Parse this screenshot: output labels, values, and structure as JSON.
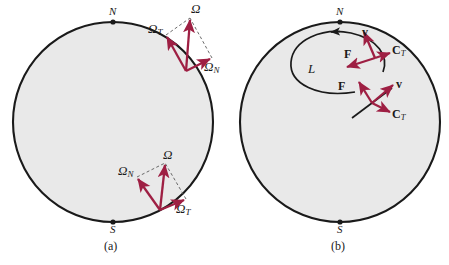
{
  "figure": {
    "type": "physics-diagram",
    "colors": {
      "arrow": "#9e1f43",
      "outline": "#1a1a1a",
      "fill": "#e9e9e9",
      "dashed": "#5a5a5a",
      "background": "#ffffff",
      "text": "#1a1a1a"
    },
    "panels": [
      {
        "id": "a",
        "caption": "(a)",
        "circle": {
          "cx": 113,
          "cy": 122,
          "r": 100
        },
        "poles": [
          {
            "name": "north-pole",
            "label": "N",
            "x": 113,
            "y": 22
          },
          {
            "name": "south-pole",
            "label": "S",
            "x": 113,
            "y": 222
          }
        ],
        "vector_groups": [
          {
            "name": "northern-hemisphere-omega",
            "origin_x": 186,
            "origin_y": 71,
            "vectors": [
              {
                "label": "Ω",
                "sub": "",
                "name": "omega-vector",
                "tip_x": 190,
                "tip_y": 18,
                "label_x": 192,
                "label_y": 4
              },
              {
                "label": "Ω",
                "sub": "T",
                "name": "omega-tangential-vector",
                "tip_x": 166,
                "tip_y": 35,
                "label_x": 149,
                "label_y": 24
              },
              {
                "label": "Ω",
                "sub": "N",
                "name": "omega-normal-vector",
                "tip_x": 212,
                "tip_y": 58,
                "label_x": 206,
                "label_y": 62
              }
            ]
          },
          {
            "name": "southern-hemisphere-omega",
            "origin_x": 160,
            "origin_y": 210,
            "vectors": [
              {
                "label": "Ω",
                "sub": "",
                "name": "omega-vector",
                "tip_x": 165,
                "tip_y": 163,
                "label_x": 166,
                "label_y": 150
              },
              {
                "label": "Ω",
                "sub": "N",
                "name": "omega-normal-vector",
                "tip_x": 137,
                "tip_y": 177,
                "label_x": 120,
                "label_y": 166
              },
              {
                "label": "Ω",
                "sub": "T",
                "name": "omega-tangential-vector",
                "tip_x": 186,
                "tip_y": 199,
                "label_x": 179,
                "label_y": 205
              }
            ]
          }
        ]
      },
      {
        "id": "b",
        "caption": "(b)",
        "circle": {
          "cx": 340,
          "cy": 122,
          "r": 100
        },
        "poles": [
          {
            "name": "north-pole",
            "label": "N",
            "x": 340,
            "y": 22
          },
          {
            "name": "south-pole",
            "label": "S",
            "x": 340,
            "y": 222
          }
        ],
        "trajectory": {
          "name": "trajectory-curve",
          "label": "L",
          "label_x": 310,
          "label_y": 68
        },
        "vector_groups": [
          {
            "name": "upper-force-group",
            "origin_x": 375,
            "origin_y": 58,
            "vectors": [
              {
                "label": "v",
                "sub": "",
                "name": "velocity-vector",
                "tip_x": 363,
                "tip_y": 30,
                "label_x": 364,
                "label_y": 30
              },
              {
                "label": "C",
                "sub": "T",
                "name": "coriolis-tangential-vector",
                "tip_x": 392,
                "tip_y": 52,
                "label_x": 394,
                "label_y": 47
              },
              {
                "label": "F",
                "sub": "",
                "name": "force-vector",
                "tip_x": 345,
                "tip_y": 66,
                "label_x": 347,
                "label_y": 52
              }
            ]
          },
          {
            "name": "lower-force-group",
            "origin_x": 372,
            "origin_y": 103,
            "vectors": [
              {
                "label": "F",
                "sub": "",
                "name": "force-vector",
                "tip_x": 358,
                "tip_y": 80,
                "label_x": 342,
                "label_y": 84
              },
              {
                "label": "v",
                "sub": "",
                "name": "velocity-vector",
                "tip_x": 395,
                "tip_y": 83,
                "label_x": 397,
                "label_y": 82
              },
              {
                "label": "C",
                "sub": "T",
                "name": "coriolis-tangential-vector",
                "tip_x": 392,
                "tip_y": 113,
                "label_x": 394,
                "label_y": 110
              }
            ]
          }
        ]
      }
    ]
  }
}
